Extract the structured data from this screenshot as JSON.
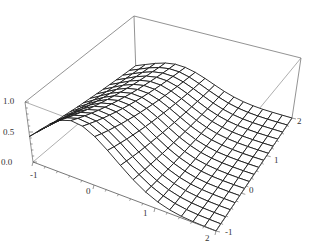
{
  "chart_data": {
    "type": "surface3d",
    "title": "",
    "xlabel": "",
    "ylabel": "",
    "zlabel": "",
    "x_range": [
      -1,
      2
    ],
    "y_range": [
      -1,
      2
    ],
    "z_range": [
      0,
      1.0
    ],
    "x_ticks": [
      "-1",
      "0",
      "1",
      "2"
    ],
    "y_ticks": [
      "-1",
      "0",
      "1",
      "2"
    ],
    "z_ticks": [
      "0.0",
      "0.5",
      "1.0"
    ],
    "mesh": {
      "x_lines": 16,
      "y_lines": 16
    },
    "box": true,
    "grid": false,
    "legend": null
  },
  "colors": {
    "mesh": "#1a1a1a",
    "box": "#777777",
    "background": "#ffffff"
  }
}
